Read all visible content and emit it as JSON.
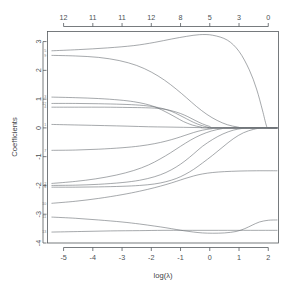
{
  "chart_data": {
    "type": "line",
    "title": "",
    "subtitle": "",
    "xlabel": "log(λ)",
    "ylabel": "Coefficients",
    "top_axis_label": "",
    "xlim": [
      -5.55,
      2.35
    ],
    "ylim": [
      -4.0,
      3.35
    ],
    "xticks": [
      -5,
      -4,
      -3,
      -2,
      -1,
      0,
      1,
      2
    ],
    "xtick_labels": [
      "-5",
      "-4",
      "-3",
      "-2",
      "-1",
      "0",
      "1",
      "2"
    ],
    "yticks": [
      3,
      2,
      1,
      0,
      -1,
      -2,
      -3,
      -4
    ],
    "ytick_labels": [
      "3",
      "2",
      "1",
      "0",
      "-1",
      "-2",
      "-3",
      "-4"
    ],
    "top_ticks": [
      -5,
      -4,
      -3,
      -2,
      -1,
      0,
      1,
      2
    ],
    "top_tick_labels": [
      "12",
      "11",
      "11",
      "12",
      "8",
      "5",
      "3",
      "0"
    ],
    "grid": false,
    "legend": "none",
    "series": [
      {
        "name": "var-5",
        "label": "5",
        "points": [
          [
            -5.4,
            2.68
          ],
          [
            -4.5,
            2.72
          ],
          [
            -3.5,
            2.78
          ],
          [
            -2.6,
            2.86
          ],
          [
            -1.9,
            2.97
          ],
          [
            -1.3,
            3.09
          ],
          [
            -0.8,
            3.18
          ],
          [
            -0.35,
            3.24
          ],
          [
            0.1,
            3.22
          ],
          [
            0.6,
            3.05
          ],
          [
            1.0,
            2.66
          ],
          [
            1.35,
            2.02
          ],
          [
            1.6,
            1.35
          ],
          [
            1.8,
            0.62
          ],
          [
            1.93,
            0.1
          ],
          [
            2.0,
            0.0
          ],
          [
            2.3,
            0.0
          ]
        ]
      },
      {
        "name": "var-9",
        "label": "9",
        "points": [
          [
            -5.4,
            2.52
          ],
          [
            -4.6,
            2.5
          ],
          [
            -3.8,
            2.45
          ],
          [
            -3.1,
            2.34
          ],
          [
            -2.5,
            2.17
          ],
          [
            -2.0,
            1.94
          ],
          [
            -1.55,
            1.66
          ],
          [
            -1.15,
            1.35
          ],
          [
            -0.8,
            1.05
          ],
          [
            -0.45,
            0.74
          ],
          [
            -0.1,
            0.47
          ],
          [
            0.25,
            0.26
          ],
          [
            0.6,
            0.11
          ],
          [
            0.95,
            0.03
          ],
          [
            1.2,
            0.0
          ],
          [
            2.3,
            0.0
          ]
        ]
      },
      {
        "name": "var-3",
        "label": "3",
        "points": [
          [
            -5.4,
            1.07
          ],
          [
            -4.6,
            1.05
          ],
          [
            -3.8,
            1.02
          ],
          [
            -3.1,
            0.97
          ],
          [
            -2.6,
            0.91
          ],
          [
            -2.2,
            0.83
          ],
          [
            -1.9,
            0.74
          ],
          [
            -1.65,
            0.63
          ],
          [
            -1.4,
            0.5
          ],
          [
            -1.15,
            0.36
          ],
          [
            -0.9,
            0.22
          ],
          [
            -0.6,
            0.1
          ],
          [
            -0.3,
            0.03
          ],
          [
            -0.05,
            0.0
          ],
          [
            2.3,
            0.0
          ]
        ]
      },
      {
        "name": "var-12",
        "label": "12",
        "points": [
          [
            -5.4,
            0.85
          ],
          [
            -4.6,
            0.85
          ],
          [
            -3.8,
            0.84
          ],
          [
            -3.0,
            0.82
          ],
          [
            -2.4,
            0.79
          ],
          [
            -1.95,
            0.74
          ],
          [
            -1.6,
            0.67
          ],
          [
            -1.3,
            0.57
          ],
          [
            -1.05,
            0.45
          ],
          [
            -0.8,
            0.32
          ],
          [
            -0.55,
            0.19
          ],
          [
            -0.3,
            0.09
          ],
          [
            -0.05,
            0.02
          ],
          [
            0.15,
            0.0
          ],
          [
            2.3,
            0.0
          ]
        ]
      },
      {
        "name": "var-4",
        "label": "4",
        "points": [
          [
            -5.4,
            0.72
          ],
          [
            -4.5,
            0.72
          ],
          [
            -3.6,
            0.72
          ],
          [
            -2.8,
            0.71
          ],
          [
            -2.2,
            0.7
          ],
          [
            -1.8,
            0.68
          ],
          [
            -1.5,
            0.64
          ],
          [
            -1.25,
            0.58
          ],
          [
            -1.0,
            0.5
          ],
          [
            -0.75,
            0.39
          ],
          [
            -0.5,
            0.26
          ],
          [
            -0.25,
            0.14
          ],
          [
            0.0,
            0.05
          ],
          [
            0.25,
            0.0
          ],
          [
            2.3,
            0.0
          ]
        ]
      },
      {
        "name": "var-1",
        "label": "1",
        "points": [
          [
            -5.4,
            0.12
          ],
          [
            -4.5,
            0.1
          ],
          [
            -3.6,
            0.08
          ],
          [
            -2.8,
            0.06
          ],
          [
            -2.1,
            0.04
          ],
          [
            -1.5,
            0.03
          ],
          [
            -0.9,
            0.02
          ],
          [
            -0.3,
            0.01
          ],
          [
            0.3,
            0.0
          ],
          [
            2.3,
            0.0
          ]
        ]
      },
      {
        "name": "var-7",
        "label": "7",
        "points": [
          [
            -5.4,
            -0.78
          ],
          [
            -4.6,
            -0.77
          ],
          [
            -3.8,
            -0.74
          ],
          [
            -3.0,
            -0.69
          ],
          [
            -2.4,
            -0.63
          ],
          [
            -1.9,
            -0.55
          ],
          [
            -1.5,
            -0.46
          ],
          [
            -1.15,
            -0.36
          ],
          [
            -0.85,
            -0.26
          ],
          [
            -0.55,
            -0.16
          ],
          [
            -0.25,
            -0.08
          ],
          [
            0.05,
            -0.03
          ],
          [
            0.35,
            0.0
          ],
          [
            2.3,
            0.0
          ]
        ]
      },
      {
        "name": "var-2",
        "label": "2",
        "points": [
          [
            -5.4,
            -1.93
          ],
          [
            -4.6,
            -1.86
          ],
          [
            -3.9,
            -1.77
          ],
          [
            -3.2,
            -1.64
          ],
          [
            -2.6,
            -1.48
          ],
          [
            -2.1,
            -1.29
          ],
          [
            -1.7,
            -1.08
          ],
          [
            -1.35,
            -0.87
          ],
          [
            -1.0,
            -0.64
          ],
          [
            -0.65,
            -0.42
          ],
          [
            -0.3,
            -0.24
          ],
          [
            0.05,
            -0.11
          ],
          [
            0.4,
            -0.03
          ],
          [
            0.65,
            0.0
          ],
          [
            2.3,
            0.0
          ]
        ]
      },
      {
        "name": "var-8",
        "label": "8",
        "points": [
          [
            -5.4,
            -2.0
          ],
          [
            -4.6,
            -1.99
          ],
          [
            -3.8,
            -1.96
          ],
          [
            -3.0,
            -1.9
          ],
          [
            -2.4,
            -1.82
          ],
          [
            -1.9,
            -1.7
          ],
          [
            -1.5,
            -1.55
          ],
          [
            -1.15,
            -1.36
          ],
          [
            -0.85,
            -1.15
          ],
          [
            -0.55,
            -0.9
          ],
          [
            -0.25,
            -0.64
          ],
          [
            0.1,
            -0.4
          ],
          [
            0.45,
            -0.21
          ],
          [
            0.8,
            -0.08
          ],
          [
            1.1,
            -0.02
          ],
          [
            1.3,
            0.0
          ],
          [
            2.3,
            0.0
          ]
        ]
      },
      {
        "name": "var-6",
        "label": "6",
        "points": [
          [
            -5.4,
            -2.06
          ],
          [
            -4.6,
            -2.06
          ],
          [
            -3.8,
            -2.05
          ],
          [
            -3.0,
            -2.03
          ],
          [
            -2.4,
            -2.0
          ],
          [
            -1.9,
            -1.95
          ],
          [
            -1.5,
            -1.87
          ],
          [
            -1.15,
            -1.76
          ],
          [
            -0.85,
            -1.62
          ],
          [
            -0.55,
            -1.44
          ],
          [
            -0.25,
            -1.22
          ],
          [
            0.1,
            -0.95
          ],
          [
            0.45,
            -0.66
          ],
          [
            0.8,
            -0.38
          ],
          [
            1.15,
            -0.17
          ],
          [
            1.5,
            -0.05
          ],
          [
            1.8,
            0.0
          ],
          [
            2.3,
            0.0
          ]
        ]
      },
      {
        "name": "var-10",
        "label": "10",
        "points": [
          [
            -5.4,
            -2.62
          ],
          [
            -4.6,
            -2.55
          ],
          [
            -3.8,
            -2.45
          ],
          [
            -3.0,
            -2.32
          ],
          [
            -2.4,
            -2.2
          ],
          [
            -1.9,
            -2.08
          ],
          [
            -1.5,
            -1.97
          ],
          [
            -1.15,
            -1.86
          ],
          [
            -0.85,
            -1.76
          ],
          [
            -0.55,
            -1.67
          ],
          [
            -0.25,
            -1.6
          ],
          [
            0.1,
            -1.55
          ],
          [
            0.5,
            -1.52
          ],
          [
            1.0,
            -1.5
          ],
          [
            1.6,
            -1.49
          ],
          [
            2.3,
            -1.49
          ]
        ]
      },
      {
        "name": "var-11",
        "label": "11",
        "points": [
          [
            -5.4,
            -3.1
          ],
          [
            -4.6,
            -3.14
          ],
          [
            -3.8,
            -3.2
          ],
          [
            -3.0,
            -3.27
          ],
          [
            -2.4,
            -3.34
          ],
          [
            -1.9,
            -3.41
          ],
          [
            -1.5,
            -3.47
          ],
          [
            -1.15,
            -3.53
          ],
          [
            -0.85,
            -3.58
          ],
          [
            -0.55,
            -3.62
          ],
          [
            -0.25,
            -3.65
          ],
          [
            0.1,
            -3.66
          ],
          [
            0.5,
            -3.65
          ],
          [
            0.9,
            -3.6
          ],
          [
            1.2,
            -3.5
          ],
          [
            1.45,
            -3.38
          ],
          [
            1.7,
            -3.27
          ],
          [
            2.0,
            -3.21
          ],
          [
            2.3,
            -3.2
          ]
        ]
      },
      {
        "name": "var-13",
        "label": "13",
        "points": [
          [
            -5.4,
            -3.62
          ],
          [
            -4.4,
            -3.6
          ],
          [
            -3.4,
            -3.58
          ],
          [
            -2.4,
            -3.57
          ],
          [
            -1.6,
            -3.56
          ],
          [
            -0.9,
            -3.56
          ],
          [
            -0.3,
            -3.56
          ],
          [
            0.3,
            -3.56
          ],
          [
            0.9,
            -3.56
          ],
          [
            1.4,
            -3.56
          ],
          [
            1.9,
            -3.56
          ],
          [
            2.3,
            -3.56
          ]
        ]
      }
    ]
  }
}
